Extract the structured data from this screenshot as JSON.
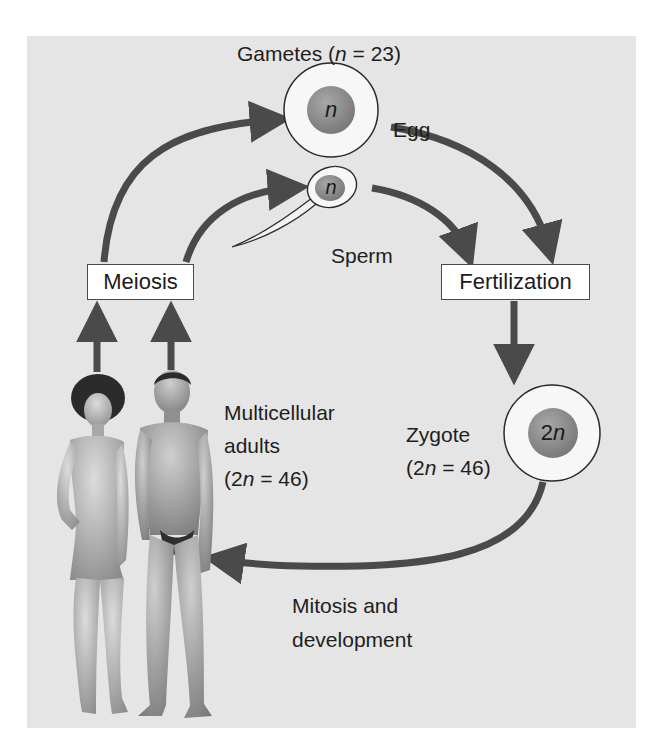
{
  "figure": {
    "title_prefix": "Gametes (",
    "title_var": "n",
    "title_suffix": " = 23)",
    "egg": {
      "label": "Egg",
      "nucleus_label": "n"
    },
    "sperm": {
      "label": "Sperm",
      "nucleus_label": "n"
    },
    "meiosis_box": {
      "label": "Meiosis"
    },
    "fertilization_box": {
      "label": "Fertilization"
    },
    "zygote": {
      "nucleus_label_num": "2",
      "nucleus_label_var": "n",
      "line1": "Zygote",
      "line2_prefix": "(2",
      "line2_var": "n",
      "line2_suffix": " = 46)"
    },
    "adults": {
      "line1": "Multicellular",
      "line2": "adults",
      "line3_prefix": "(2",
      "line3_var": "n",
      "line3_suffix": " = 46)"
    },
    "mitosis": {
      "line1": "Mitosis and",
      "line2": "development"
    },
    "colors": {
      "panel_bg": "#e5e5e5",
      "arrow": "#4a4a4a",
      "nucleus": "#8a8a8a",
      "cell_fill": "#f4f4f4",
      "skin": "#bdbdbd"
    }
  }
}
